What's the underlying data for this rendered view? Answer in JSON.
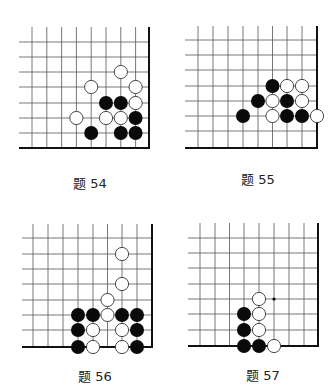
{
  "problems": [
    {
      "id": "54",
      "label": "题 54",
      "label_pos": [
        90,
        182
      ],
      "grid": {
        "cols_x": [
          32,
          46.8,
          61.6,
          76.4,
          91.2,
          106,
          120.8,
          135.6
        ],
        "rows_y": [
          42,
          57,
          72,
          87,
          103,
          118,
          133
        ],
        "left": 19,
        "top": 27,
        "right": 149,
        "bottom": 148
      },
      "stones": [
        {
          "color": "white",
          "col": 6,
          "row": 2
        },
        {
          "color": "white",
          "col": 4,
          "row": 3
        },
        {
          "color": "white",
          "col": 7,
          "row": 3
        },
        {
          "color": "black",
          "col": 5,
          "row": 4
        },
        {
          "color": "black",
          "col": 6,
          "row": 4
        },
        {
          "color": "white",
          "col": 7,
          "row": 4
        },
        {
          "color": "white",
          "col": 3,
          "row": 5
        },
        {
          "color": "white",
          "col": 5,
          "row": 5
        },
        {
          "color": "white",
          "col": 6,
          "row": 5
        },
        {
          "color": "black",
          "col": 7,
          "row": 5
        },
        {
          "color": "black",
          "col": 4,
          "row": 6
        },
        {
          "color": "black",
          "col": 6,
          "row": 6
        },
        {
          "color": "black",
          "col": 7,
          "row": 6
        }
      ],
      "marks": []
    },
    {
      "id": "55",
      "label": "题 55",
      "label_pos": [
        258,
        178
      ],
      "grid": {
        "cols_x": [
          198,
          213,
          228,
          243,
          258,
          272.5,
          287,
          302
        ],
        "rows_y": [
          40,
          55,
          70,
          86,
          101,
          116,
          131
        ],
        "left": 185,
        "top": 26,
        "right": 317,
        "bottom": 148
      },
      "stones": [
        {
          "color": "black",
          "col": 5,
          "row": 3
        },
        {
          "color": "white",
          "col": 6,
          "row": 3
        },
        {
          "color": "white",
          "col": 7,
          "row": 3
        },
        {
          "color": "black",
          "col": 4,
          "row": 4
        },
        {
          "color": "white",
          "col": 5,
          "row": 4
        },
        {
          "color": "black",
          "col": 6,
          "row": 4
        },
        {
          "color": "white",
          "col": 7,
          "row": 4
        },
        {
          "color": "black",
          "col": 3,
          "row": 5
        },
        {
          "color": "white",
          "col": 5,
          "row": 5
        },
        {
          "color": "black",
          "col": 6,
          "row": 5
        },
        {
          "color": "black",
          "col": 7,
          "row": 5
        },
        {
          "color": "white",
          "col": 8,
          "row": 5
        }
      ],
      "marks": []
    },
    {
      "id": "56",
      "label": "题 56",
      "label_pos": [
        95,
        375
      ],
      "grid": {
        "cols_x": [
          33,
          48,
          63,
          78,
          93,
          107.5,
          122,
          137
        ],
        "rows_y": [
          238,
          254,
          269,
          284,
          300,
          315,
          330
        ],
        "left": 22,
        "top": 224,
        "right": 152,
        "bottom": 347
      },
      "stones": [
        {
          "color": "white",
          "col": 6,
          "row": 1
        },
        {
          "color": "white",
          "col": 6,
          "row": 3
        },
        {
          "color": "white",
          "col": 5,
          "row": 4
        },
        {
          "color": "black",
          "col": 3,
          "row": 5
        },
        {
          "color": "black",
          "col": 4,
          "row": 5
        },
        {
          "color": "white",
          "col": 5,
          "row": 5
        },
        {
          "color": "black",
          "col": 6,
          "row": 5
        },
        {
          "color": "black",
          "col": 7,
          "row": 5
        },
        {
          "color": "black",
          "col": 3,
          "row": 6
        },
        {
          "color": "white",
          "col": 4,
          "row": 6
        },
        {
          "color": "white",
          "col": 6,
          "row": 6
        },
        {
          "color": "black",
          "col": 7,
          "row": 6
        },
        {
          "color": "black",
          "col": 3,
          "row": 7
        },
        {
          "color": "white",
          "col": 4,
          "row": 7
        },
        {
          "color": "white",
          "col": 6,
          "row": 7
        },
        {
          "color": "black",
          "col": 7,
          "row": 7
        }
      ],
      "marks": []
    },
    {
      "id": "57",
      "label": "题 57",
      "label_pos": [
        263,
        374
      ],
      "grid": {
        "cols_x": [
          200,
          215,
          229.5,
          244,
          259,
          274,
          289,
          304
        ],
        "rows_y": [
          238,
          253,
          268,
          284,
          299,
          314,
          330
        ],
        "left": 188,
        "top": 223,
        "right": 318,
        "bottom": 346
      },
      "stones": [
        {
          "color": "white",
          "col": 4,
          "row": 4
        },
        {
          "color": "black",
          "col": 3,
          "row": 5
        },
        {
          "color": "white",
          "col": 4,
          "row": 5
        },
        {
          "color": "black",
          "col": 3,
          "row": 6
        },
        {
          "color": "white",
          "col": 4,
          "row": 6
        },
        {
          "color": "black",
          "col": 3,
          "row": 7
        },
        {
          "color": "black",
          "col": 4,
          "row": 7
        },
        {
          "color": "white",
          "col": 5,
          "row": 7
        }
      ],
      "marks": [
        {
          "type": "dot",
          "col": 5,
          "row": 4
        }
      ]
    }
  ],
  "style": {
    "line_color": "#555555",
    "edge_color": "#111111",
    "black_stone": "#0a0a0a",
    "white_stone_fill": "#ffffff",
    "white_stone_stroke": "#333333",
    "stone_radius": 7
  }
}
